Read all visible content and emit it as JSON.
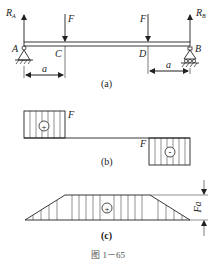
{
  "beam": {
    "support_a_label": "A",
    "support_b_label": "B",
    "point_c_label": "C",
    "point_d_label": "D",
    "reaction_a": {
      "main": "R",
      "sub": "A"
    },
    "reaction_b": {
      "main": "R",
      "sub": "B"
    },
    "force_c_label": "F",
    "force_d_label": "F",
    "dim_left_label": "a",
    "dim_right_label": "a",
    "caption": "(a)"
  },
  "shear_diagram": {
    "left_value_label": "F",
    "right_value_label": "F",
    "left_sign": "+",
    "right_sign": "-",
    "caption": "(b)"
  },
  "moment_diagram": {
    "sign": "+",
    "max_label": "Fa",
    "caption": "(c)"
  },
  "figure_caption": "图 1－65",
  "colors": {
    "line": "#222222",
    "background": "#ffffff"
  }
}
